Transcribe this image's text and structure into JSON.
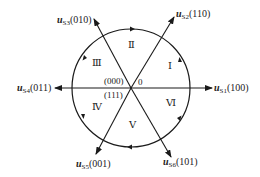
{
  "diagram": {
    "center": {
      "x": 131,
      "y": 88
    },
    "radius": 59,
    "colors": {
      "stroke": "#1a1a1a",
      "text": "#222222",
      "background": "#ffffff"
    },
    "vectors": [
      {
        "id": "us1",
        "base": "u",
        "sub": "S1",
        "state": "(100)",
        "angle_deg": 0
      },
      {
        "id": "us2",
        "base": "u",
        "sub": "S2",
        "state": "(110)",
        "angle_deg": 60
      },
      {
        "id": "us3",
        "base": "u",
        "sub": "S3",
        "state": "(010)",
        "angle_deg": 120
      },
      {
        "id": "us4",
        "base": "u",
        "sub": "S4",
        "state": "(011)",
        "angle_deg": 180
      },
      {
        "id": "us5",
        "base": "u",
        "sub": "S5",
        "state": "(001)",
        "angle_deg": 240
      },
      {
        "id": "us6",
        "base": "u",
        "sub": "S6",
        "state": "(101)",
        "angle_deg": 300
      }
    ],
    "sectors": [
      "Ⅰ",
      "Ⅱ",
      "Ⅲ",
      "Ⅳ",
      "Ⅴ",
      "Ⅵ"
    ],
    "zero_vectors": {
      "upper": "(000)",
      "lower": "(111)"
    },
    "origin_label": "0",
    "rotation": "counterclockwise"
  }
}
